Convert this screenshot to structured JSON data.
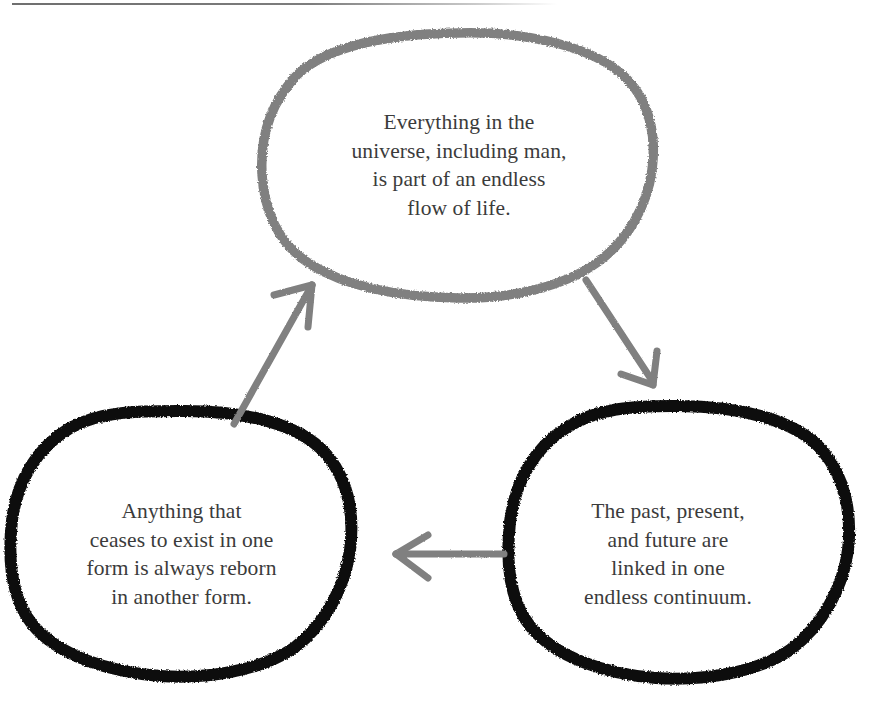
{
  "diagram": {
    "type": "cycle",
    "colors": {
      "bubble_top_stroke": "#808080",
      "bubble_bottom_stroke": "#0d0d0d",
      "arrow": "#808080",
      "text": "#3b3b3b",
      "background": "#ffffff",
      "top_rule": "#6f6f6f"
    },
    "nodes": [
      {
        "id": "top",
        "label": "Everything in the\nuniverse, including man,\nis part of an endless\nflow of life.",
        "stroke_color": "#808080",
        "position": "top-center"
      },
      {
        "id": "bottom-left",
        "label": "Anything that\nceases to exist in one\nform is always reborn\nin another form.",
        "stroke_color": "#0d0d0d",
        "position": "bottom-left"
      },
      {
        "id": "bottom-right",
        "label": "The past, present,\nand future are\nlinked in one\nendless continuum.",
        "stroke_color": "#0d0d0d",
        "position": "bottom-right"
      }
    ],
    "arrows": [
      {
        "id": "top-to-right",
        "from": "top",
        "to": "bottom-right",
        "direction": "down-right"
      },
      {
        "id": "right-to-left",
        "from": "bottom-right",
        "to": "bottom-left",
        "direction": "left"
      },
      {
        "id": "left-to-top",
        "from": "bottom-left",
        "to": "top",
        "direction": "up-right"
      }
    ]
  }
}
